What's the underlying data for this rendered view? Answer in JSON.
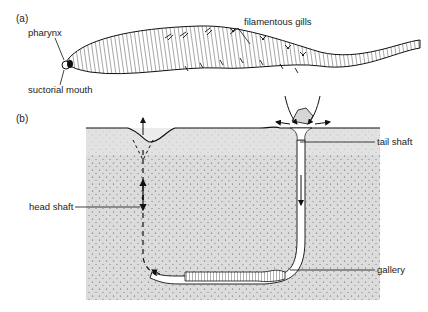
{
  "panel_a": {
    "tag": "(a)",
    "labels": {
      "pharynx": "pharynx",
      "suctorial_mouth": "suctorial mouth",
      "filamentous_gills": "filamentous gills"
    }
  },
  "panel_b": {
    "tag": "(b)",
    "labels": {
      "tail_shaft": "tail shaft",
      "head_shaft": "head shaft",
      "gallery": "gallery"
    }
  },
  "colors": {
    "sediment": "#d9d9d9",
    "surface_layer": "#e6e6e6",
    "burrow": "#ffffff",
    "ink": "#1a1a1a"
  }
}
